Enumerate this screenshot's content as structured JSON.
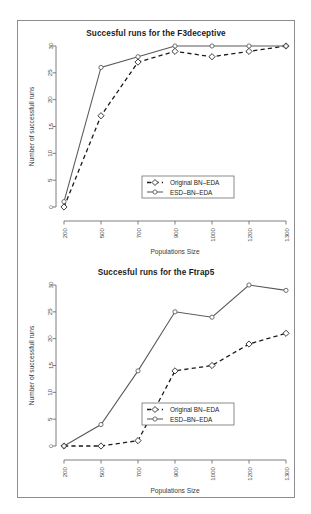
{
  "figure": {
    "background_color": "#ffffff",
    "frame_color": "#8d8d8d"
  },
  "charts": [
    {
      "panel_name": "top",
      "title": "Succesful runs for the F3deceptive",
      "xlabel": "Populations Size",
      "ylabel": "Number of successfull runs",
      "legend": {
        "items": [
          {
            "label": "Original BN–EDA",
            "style": "dashed",
            "marker": "diamond"
          },
          {
            "label": "ESD–BN–EDA",
            "style": "solid",
            "marker": "circle"
          }
        ]
      }
    },
    {
      "panel_name": "bottom",
      "title": "Succesful runs for the Ftrap5",
      "xlabel": "Populations Size",
      "ylabel": "Number of successfull runs",
      "legend": {
        "items": [
          {
            "label": "Original BN–EDA",
            "style": "dashed",
            "marker": "diamond"
          },
          {
            "label": "ESD–BN–EDA",
            "style": "solid",
            "marker": "circle"
          }
        ]
      }
    }
  ],
  "chart_data": [
    {
      "type": "line",
      "title": "Succesful runs for the F3deceptive",
      "xlabel": "Populations Size",
      "ylabel": "Number of successfull runs",
      "categories": [
        "200",
        "500",
        "700",
        "900",
        "1000",
        "1200",
        "1300"
      ],
      "yticks": [
        0,
        5,
        10,
        15,
        20,
        25,
        30
      ],
      "ylim": [
        0,
        30
      ],
      "grid": false,
      "legend_position": "bottom-center",
      "series": [
        {
          "name": "Original BN–EDA",
          "style": "dashed",
          "marker": "diamond",
          "color": "#1a1a1a",
          "values": [
            0,
            17,
            27,
            29,
            28,
            29,
            30
          ]
        },
        {
          "name": "ESD–BN–EDA",
          "style": "solid",
          "marker": "circle",
          "color": "#585858",
          "values": [
            1,
            26,
            28,
            30,
            30,
            30,
            30
          ]
        }
      ]
    },
    {
      "type": "line",
      "title": "Succesful runs for the Ftrap5",
      "xlabel": "Populations Size",
      "ylabel": "Number of successfull runs",
      "categories": [
        "200",
        "500",
        "700",
        "900",
        "1000",
        "1200",
        "1300"
      ],
      "yticks": [
        0,
        5,
        10,
        15,
        20,
        25,
        30
      ],
      "ylim": [
        0,
        30
      ],
      "grid": false,
      "legend_position": "bottom-center",
      "series": [
        {
          "name": "Original BN–EDA",
          "style": "dashed",
          "marker": "diamond",
          "color": "#1a1a1a",
          "values": [
            0,
            0,
            1,
            14,
            15,
            19,
            21
          ]
        },
        {
          "name": "ESD–BN–EDA",
          "style": "solid",
          "marker": "circle",
          "color": "#585858",
          "values": [
            0,
            4,
            14,
            25,
            24,
            30,
            29
          ]
        }
      ]
    }
  ]
}
